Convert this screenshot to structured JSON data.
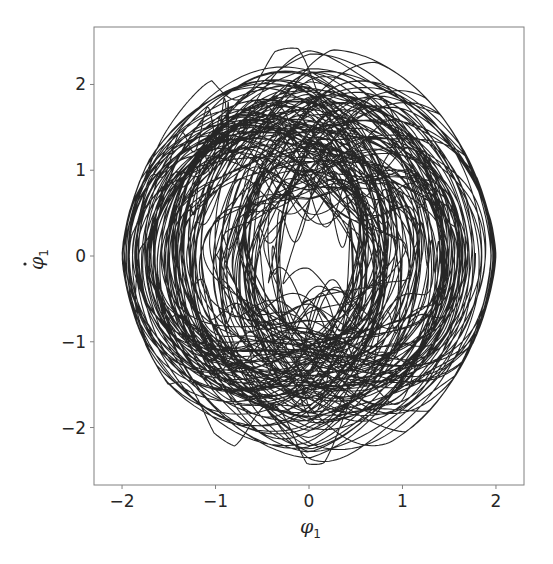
{
  "chart_data": {
    "type": "line",
    "title": "",
    "xlabel": "φ1",
    "ylabel": "φ̇1",
    "xlim": [
      -2.3,
      2.3
    ],
    "ylim": [
      -2.67,
      2.67
    ],
    "x_ticks": [
      -2,
      -1,
      0,
      1,
      2
    ],
    "y_ticks": [
      -2,
      -1,
      0,
      1,
      2
    ],
    "x_tick_labels": [
      "−2",
      "−1",
      "0",
      "1",
      "2"
    ],
    "y_tick_labels": [
      "−2",
      "−1",
      "0",
      "1",
      "2"
    ],
    "grid": false,
    "legend": null,
    "series": [
      {
        "name": "phase-space trajectory",
        "color": "#000000",
        "description": "Dense quasi-periodic/chaotic phase portrait of φ1 vs dφ1/dt, diamond-shaped envelope",
        "x_range": [
          -2.0,
          2.0
        ],
        "y_range": [
          -2.42,
          2.42
        ],
        "envelope": {
          "max_x_at_y0": 2.0,
          "max_y_at_x0": 2.42,
          "shoulder_points": [
            [
              -1.7,
              0.9
            ],
            [
              1.7,
              0.9
            ],
            [
              -1.7,
              -0.9
            ],
            [
              1.7,
              -0.9
            ]
          ]
        }
      }
    ]
  },
  "axes": {
    "frame_color": "#808080",
    "line_color": "#000000"
  }
}
